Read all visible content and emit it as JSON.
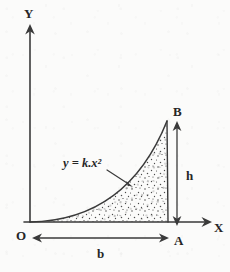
{
  "figure": {
    "ink_color": "#3a3a3a",
    "text_color": "#262626",
    "background_color": "#fbfbfa"
  },
  "axes": {
    "y_axis_label": "Y",
    "x_axis_label": "X",
    "origin_label": "O",
    "origin": {
      "x": 30,
      "y": 222
    },
    "y_axis_top": {
      "x": 30,
      "y": 27
    },
    "x_axis_right": {
      "x": 210,
      "y": 222
    }
  },
  "points": {
    "origin": "O",
    "base_end": "A",
    "curve_top": "B"
  },
  "curve": {
    "equation_label": "y = k.x²",
    "equation_label_pos": {
      "x": 88,
      "y": 166
    },
    "start": {
      "x": 30,
      "y": 222
    },
    "end": {
      "x": 167,
      "y": 121
    },
    "exponent": 2
  },
  "dimensions": [
    {
      "name": "base",
      "label": "b",
      "orientation": "horizontal",
      "from": {
        "x": 33,
        "y": 238
      },
      "to": {
        "x": 168,
        "y": 238
      },
      "label_pos": {
        "x": 100,
        "y": 256
      }
    },
    {
      "name": "height",
      "label": "h",
      "orientation": "vertical",
      "from": {
        "x": 177,
        "y": 123
      },
      "to": {
        "x": 177,
        "y": 224
      },
      "label_pos": {
        "x": 190,
        "y": 175
      }
    }
  ],
  "shading": {
    "style": "stipple-dots",
    "region": "area bounded by curve, vertical line AB and x-axis",
    "dot_color": "#4a4a4a"
  },
  "annotations": {
    "pointer_from": {
      "x": 112,
      "y": 172
    },
    "pointer_to": {
      "x": 131,
      "y": 186
    }
  }
}
